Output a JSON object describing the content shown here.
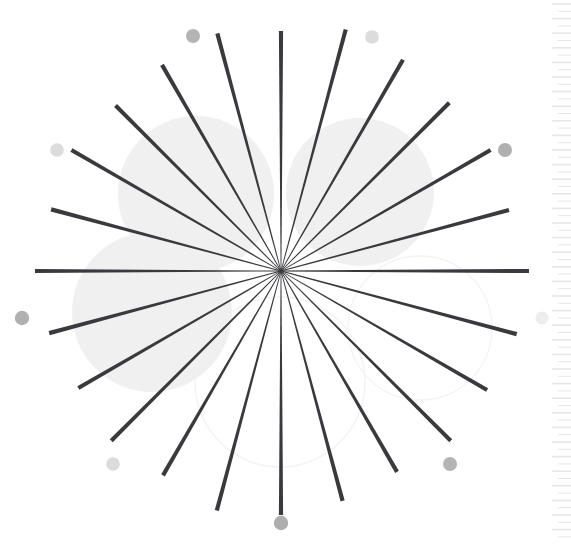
{
  "figure": {
    "width": 571,
    "height": 547,
    "background_color": "#ffffff",
    "center": {
      "x": 281,
      "y": 271
    }
  },
  "chart_data": {
    "type": "scatter",
    "subtitle": "",
    "xlabel": "",
    "ylabel": "",
    "grid": false,
    "legend_position": "none",
    "xlim": [
      0,
      571
    ],
    "ylim": [
      0,
      547
    ],
    "center": {
      "x": 281,
      "y": 271
    },
    "spoke_count": 24,
    "spoke_angle_step_deg": 15,
    "spoke_color": "#3a3a3e",
    "spoke_inner_width": 0.8,
    "spoke_outer_width": 4.2,
    "spokes": [
      {
        "angle_deg": 0,
        "radius": 248,
        "label": "ray-0"
      },
      {
        "angle_deg": 15,
        "radius": 236,
        "label": "ray-15"
      },
      {
        "angle_deg": 30,
        "radius": 242,
        "label": "ray-30"
      },
      {
        "angle_deg": 45,
        "radius": 238,
        "label": "ray-45"
      },
      {
        "angle_deg": 60,
        "radius": 244,
        "label": "ray-60"
      },
      {
        "angle_deg": 75,
        "radius": 250,
        "label": "ray-75"
      },
      {
        "angle_deg": 90,
        "radius": 240,
        "label": "ray-90"
      },
      {
        "angle_deg": 105,
        "radius": 246,
        "label": "ray-105"
      },
      {
        "angle_deg": 120,
        "radius": 238,
        "label": "ray-120"
      },
      {
        "angle_deg": 135,
        "radius": 234,
        "label": "ray-135"
      },
      {
        "angle_deg": 150,
        "radius": 242,
        "label": "ray-150"
      },
      {
        "angle_deg": 165,
        "radius": 238,
        "label": "ray-165"
      },
      {
        "angle_deg": 180,
        "radius": 246,
        "label": "ray-180"
      },
      {
        "angle_deg": 195,
        "radius": 240,
        "label": "ray-195"
      },
      {
        "angle_deg": 210,
        "radius": 234,
        "label": "ray-210"
      },
      {
        "angle_deg": 225,
        "radius": 240,
        "label": "ray-225"
      },
      {
        "angle_deg": 240,
        "radius": 236,
        "label": "ray-240"
      },
      {
        "angle_deg": 255,
        "radius": 248,
        "label": "ray-255"
      },
      {
        "angle_deg": 270,
        "radius": 244,
        "label": "ray-270"
      },
      {
        "angle_deg": 285,
        "radius": 238,
        "label": "ray-285"
      },
      {
        "angle_deg": 300,
        "radius": 232,
        "label": "ray-300"
      },
      {
        "angle_deg": 315,
        "radius": 240,
        "label": "ray-315"
      },
      {
        "angle_deg": 330,
        "radius": 238,
        "label": "ray-330"
      },
      {
        "angle_deg": 345,
        "radius": 244,
        "label": "ray-345"
      }
    ],
    "background_blobs": [
      {
        "cx": 196,
        "cy": 194,
        "r": 78,
        "fill": "#f0f0f0",
        "style": "filled",
        "label": "blob-upper-left"
      },
      {
        "cx": 360,
        "cy": 192,
        "r": 74,
        "fill": "#f0f0f0",
        "style": "filled",
        "label": "blob-upper-right"
      },
      {
        "cx": 152,
        "cy": 312,
        "r": 80,
        "fill": "#f0f0f0",
        "style": "filled",
        "label": "blob-lower-left"
      },
      {
        "cx": 280,
        "cy": 382,
        "r": 85,
        "stroke": "#f2f2f2",
        "style": "outline",
        "label": "blob-outline-bottom-center"
      },
      {
        "cx": 420,
        "cy": 328,
        "r": 72,
        "stroke": "#f4f4f4",
        "style": "outline",
        "label": "blob-outline-lower-right"
      }
    ],
    "marker_dots": [
      {
        "cx": 193,
        "cy": 36,
        "r": 7.0,
        "color": "#b4b4b4",
        "label": "dot-top-left"
      },
      {
        "cx": 372,
        "cy": 37,
        "r": 6.8,
        "color": "#dcdcdc",
        "label": "dot-top-right"
      },
      {
        "cx": 57,
        "cy": 150,
        "r": 6.8,
        "color": "#dcdcdc",
        "label": "dot-mid-left-upper"
      },
      {
        "cx": 505,
        "cy": 150,
        "r": 7.0,
        "color": "#b0b0b0",
        "label": "dot-mid-right-upper"
      },
      {
        "cx": 22,
        "cy": 318,
        "r": 7.2,
        "color": "#b0b0b0",
        "label": "dot-mid-left-lower"
      },
      {
        "cx": 542,
        "cy": 318,
        "r": 6.5,
        "color": "#ededed",
        "label": "dot-mid-right-lower"
      },
      {
        "cx": 113,
        "cy": 464,
        "r": 6.8,
        "color": "#dcdcdc",
        "label": "dot-bottom-left"
      },
      {
        "cx": 450,
        "cy": 464,
        "r": 7.0,
        "color": "#b4b4b4",
        "label": "dot-bottom-right"
      },
      {
        "cx": 281,
        "cy": 523,
        "r": 7.2,
        "color": "#aeaeae",
        "label": "dot-bottom-center"
      }
    ],
    "ruler_strip": {
      "x_start": 552,
      "x_end": 571,
      "y_start": 4,
      "y_end": 545,
      "tick_spacing": 7.3,
      "tick_count": 74,
      "color": "#e6e6e6",
      "label": "right-edge-ruler"
    }
  }
}
